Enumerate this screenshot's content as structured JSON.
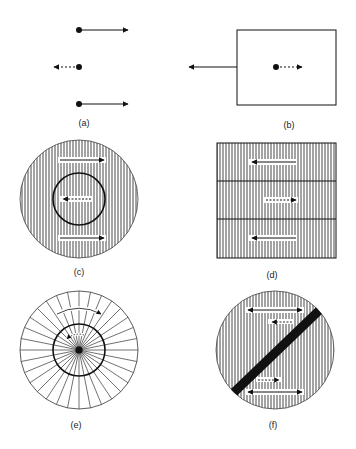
{
  "figure": {
    "panels": [
      {
        "id": "a",
        "label": "(a)",
        "description": "Three particles: outer two move right (solid arrows), middle one moves left (dotted arrow)"
      },
      {
        "id": "b",
        "label": "(b)",
        "description": "Box pulled left (solid arrow) while internal particle moves right (dotted arrow)"
      },
      {
        "id": "c",
        "label": "(c)",
        "description": "Hatched disk with inner circle; outer flow right, inner flow left (dotted)"
      },
      {
        "id": "d",
        "label": "(d)",
        "description": "Three hatched bands; outer bands move left, middle band moves right (dotted)"
      },
      {
        "id": "e",
        "label": "(e)",
        "description": "Radially divided disk with inner ring; outer rotation clockwise, inner dotted counter-rotation"
      },
      {
        "id": "f",
        "label": "(f)",
        "description": "Hatched disk split by diagonal black band; double-headed solid arrows and dotted offset arrows on each side"
      }
    ]
  },
  "colors": {
    "ink": "#111111",
    "background": "#ffffff",
    "hatch": "#333333"
  }
}
